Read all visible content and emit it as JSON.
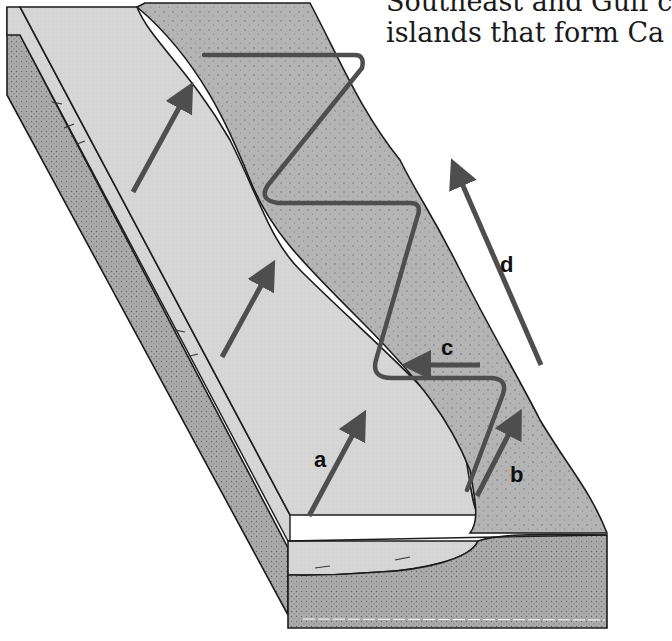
{
  "caption": {
    "line1": "Southeast and Gulf c",
    "line2": "islands that form Ca"
  },
  "diagram": {
    "labels": {
      "a": "a",
      "b": "b",
      "c": "c",
      "d": "d"
    },
    "colors": {
      "water_surface": "#d4d4d4",
      "sand_surface": "#b2b2b2",
      "sand_section": "#a8a8a8",
      "arrow": "#4e4e4e",
      "outline": "#1c1c1c",
      "background": "#ffffff"
    },
    "regions": [
      "shallow-water-surface",
      "sand-beach-surface",
      "cross-section-front",
      "cross-section-side"
    ],
    "arrows": [
      {
        "id": "wave-arrow-1",
        "direction": "up-right"
      },
      {
        "id": "wave-arrow-2",
        "direction": "up-right"
      },
      {
        "id": "wave-arrow-a",
        "direction": "up-right",
        "label": "a"
      },
      {
        "id": "swash-arrow-b",
        "direction": "up-right",
        "label": "b"
      },
      {
        "id": "backwash-arrow-c",
        "direction": "left",
        "label": "c"
      },
      {
        "id": "longshore-arrow-d",
        "direction": "up-left",
        "label": "d"
      }
    ]
  }
}
